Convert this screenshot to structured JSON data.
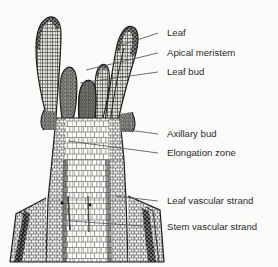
{
  "figure": {
    "kind": "botanical-line-diagram",
    "background_color": "#fbfbfa",
    "ink_color": "#1d1d1d",
    "text_color": "#2a2a2a",
    "leader_color": "#555555"
  },
  "labels": [
    {
      "id": "leaf",
      "text": "Leaf",
      "x": 167,
      "y": 36,
      "leader": {
        "x1": 158,
        "y1": 33,
        "x2": 116,
        "y2": 47
      }
    },
    {
      "id": "apical-meristem",
      "text": "Apical meristem",
      "x": 167,
      "y": 56,
      "leader": {
        "x1": 158,
        "y1": 53,
        "x2": 86,
        "y2": 70
      }
    },
    {
      "id": "leaf-bud",
      "text": "Leaf bud",
      "x": 167,
      "y": 75,
      "leader": {
        "x1": 158,
        "y1": 72,
        "x2": 80,
        "y2": 83
      }
    },
    {
      "id": "axillary-bud",
      "text": "Axillary bud",
      "x": 167,
      "y": 137,
      "leader": {
        "x1": 158,
        "y1": 134,
        "x2": 121,
        "y2": 129
      }
    },
    {
      "id": "elongation-zone",
      "text": "Elongation zone",
      "x": 167,
      "y": 156,
      "leader": {
        "x1": 158,
        "y1": 153,
        "x2": 68,
        "y2": 141
      }
    },
    {
      "id": "leaf-vascular-strand",
      "text": "Leaf vascular strand",
      "x": 167,
      "y": 204,
      "leader": {
        "x1": 158,
        "y1": 201,
        "x2": 115,
        "y2": 196
      }
    },
    {
      "id": "stem-vascular-strand",
      "text": "Stem vascular strand",
      "x": 167,
      "y": 230,
      "leader": {
        "x1": 158,
        "y1": 227,
        "x2": 70,
        "y2": 221
      }
    }
  ],
  "drawing_parts": [
    {
      "id": "left-leaf",
      "name": "left leaf primordium"
    },
    {
      "id": "right-leaf",
      "name": "right leaf primordium"
    },
    {
      "id": "inner-left-bud",
      "name": "inner left leaf bud"
    },
    {
      "id": "inner-right-bud",
      "name": "inner right leaf bud"
    },
    {
      "id": "apical-dome",
      "name": "apical meristem dome"
    },
    {
      "id": "stem-axis",
      "name": "stem axis with elongation zone"
    },
    {
      "id": "left-axillary-bud",
      "name": "left axillary bud"
    },
    {
      "id": "right-axillary-bud",
      "name": "right axillary bud"
    },
    {
      "id": "left-leaf-base",
      "name": "lower left leaf base"
    },
    {
      "id": "right-leaf-base",
      "name": "lower right leaf base"
    },
    {
      "id": "leaf-trace",
      "name": "leaf vascular strand band"
    },
    {
      "id": "stem-trace",
      "name": "stem vascular strand band"
    }
  ]
}
